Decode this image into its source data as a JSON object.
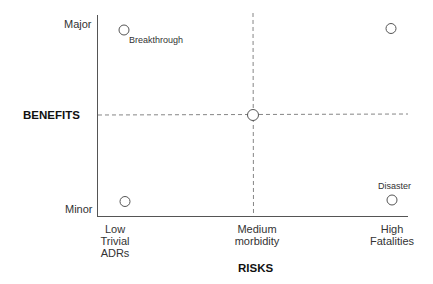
{
  "diagram": {
    "y_axis": {
      "title": "BENEFITS",
      "ticks": {
        "top": "Major",
        "bottom": "Minor"
      }
    },
    "x_axis": {
      "title": "RISKS",
      "ticks": [
        {
          "line1": "Low",
          "line2": "Trivial",
          "line3": "ADRs"
        },
        {
          "line1": "Medium",
          "line2": "morbidity"
        },
        {
          "line1": "High",
          "line2": "Fatalities"
        }
      ]
    },
    "points": [
      {
        "position": "top-left",
        "label": "Breakthrough"
      },
      {
        "position": "top-right",
        "label": ""
      },
      {
        "position": "center",
        "label": ""
      },
      {
        "position": "bottom-left",
        "label": ""
      },
      {
        "position": "bottom-right",
        "label": "Disaster"
      }
    ],
    "colors": {
      "axis": "#555555",
      "dashed": "#666666",
      "circle": "#555555"
    }
  }
}
